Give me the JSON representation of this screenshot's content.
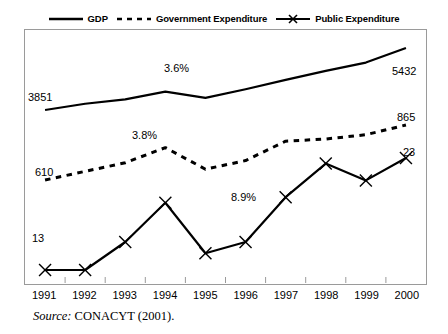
{
  "legend": {
    "entries": [
      {
        "label": "GDP",
        "style": "solid",
        "marker": "none",
        "icon": "solid-line-icon"
      },
      {
        "label": "Government Expenditure",
        "style": "dashed",
        "marker": "none",
        "icon": "dashed-line-icon"
      },
      {
        "label": "Public Expenditure",
        "style": "solid",
        "marker": "x",
        "icon": "line-with-x-marker-icon"
      }
    ]
  },
  "source": {
    "prefix": "Source:",
    "text": "CONACYT (2001)."
  },
  "chart_data": {
    "type": "line",
    "title": "",
    "xlabel": "",
    "ylabel": "",
    "grid": false,
    "legend_position": "top-center",
    "categories": [
      "1991",
      "1992",
      "1993",
      "1994",
      "1995",
      "1996",
      "1997",
      "1998",
      "1999",
      "2000"
    ],
    "series": [
      {
        "name": "GDP",
        "style": "solid",
        "marker": "none",
        "values": [
          3851,
          4010,
          4120,
          4320,
          4160,
          4380,
          4620,
          4850,
          5060,
          5432
        ],
        "endpoint_labels": {
          "start": "3851",
          "end": "5432"
        }
      },
      {
        "name": "Government Expenditure",
        "style": "dashed",
        "marker": "none",
        "values": [
          610,
          650,
          690,
          760,
          660,
          700,
          790,
          800,
          820,
          865
        ],
        "endpoint_labels": {
          "start": "610",
          "end": "865"
        }
      },
      {
        "name": "Public Expenditure",
        "style": "solid",
        "marker": "x",
        "values": [
          13,
          13,
          15.5,
          19,
          14.5,
          15.5,
          19.5,
          22.5,
          21,
          23
        ],
        "endpoint_labels": {
          "start": "13",
          "end": "23"
        }
      }
    ],
    "annotations": [
      {
        "text": "3.6%",
        "series": "GDP",
        "category": "1994"
      },
      {
        "text": "3.8%",
        "series": "Government Expenditure",
        "category": "1993"
      },
      {
        "text": "8.9%",
        "series": "Public Expenditure",
        "category": "1996"
      }
    ],
    "colors": {
      "line": "#000000",
      "frame": "#9a9a9a",
      "background": "#ffffff"
    }
  }
}
